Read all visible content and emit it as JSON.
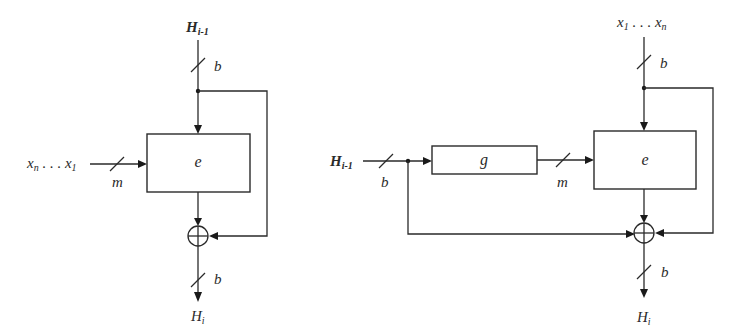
{
  "diagram": {
    "left": {
      "name": "Davies-Meyer style",
      "chaining_input": {
        "base": "H",
        "sub": "i-1"
      },
      "chaining_width": "b",
      "message_input": {
        "text_a": "x",
        "sub_a": "n",
        "dots": " . . . ",
        "text_b": "x",
        "sub_b": "1"
      },
      "message_width": "m",
      "cipher_block": "e",
      "xor_symbol": "⊕",
      "output": {
        "base": "H",
        "sub": "i"
      },
      "output_width": "b"
    },
    "right": {
      "name": "Matyas-Meyer-Oseas style",
      "chaining_input": {
        "base": "H",
        "sub": "i-1"
      },
      "chaining_width": "b",
      "key_transform_block": "g",
      "key_width": "m",
      "message_input": {
        "text_a": "x",
        "sub_a": "1",
        "dots": " . . . ",
        "text_b": "x",
        "sub_b": "n"
      },
      "message_width": "b",
      "cipher_block": "e",
      "xor_symbol": "⊕",
      "output": {
        "base": "H",
        "sub": "i"
      },
      "output_width": "b"
    }
  }
}
